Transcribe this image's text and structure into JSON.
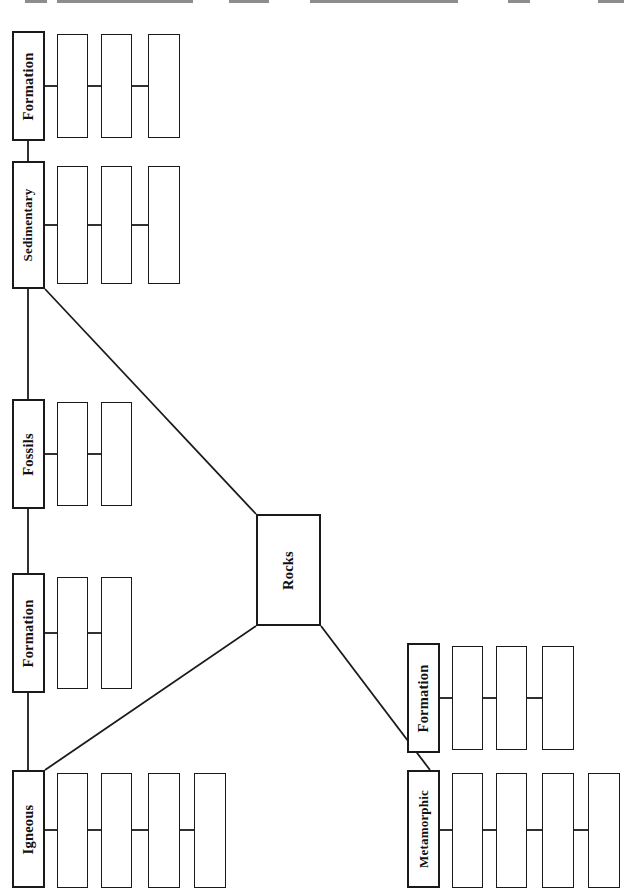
{
  "document": {
    "type": "concept-map-worksheet",
    "subject": "Rocks",
    "orientation": "rotated-90-counterclockwise",
    "page_background": "#ffffff",
    "line_color": "#1a1a1a",
    "text_color": "#111111"
  },
  "center": {
    "label": "Rocks",
    "x": 256,
    "y": 514,
    "w": 65,
    "h": 112
  },
  "branches": [
    {
      "key": "sedimentary",
      "label": "Sedimentary",
      "x": 12,
      "y": 161,
      "w": 33,
      "h": 128,
      "blanks": [
        {
          "x": 57,
          "y": 166,
          "w": 31,
          "h": 118
        },
        {
          "x": 101,
          "y": 166,
          "w": 31,
          "h": 118
        },
        {
          "x": 148,
          "y": 166,
          "w": 32,
          "h": 118
        }
      ]
    },
    {
      "key": "sedimentary-formation",
      "label": "Formation",
      "x": 12,
      "y": 31,
      "w": 33,
      "h": 110,
      "blanks": [
        {
          "x": 57,
          "y": 34,
          "w": 31,
          "h": 104
        },
        {
          "x": 101,
          "y": 34,
          "w": 31,
          "h": 104
        },
        {
          "x": 148,
          "y": 34,
          "w": 32,
          "h": 104
        }
      ]
    },
    {
      "key": "fossils",
      "label": "Fossils",
      "x": 12,
      "y": 399,
      "w": 33,
      "h": 110,
      "blanks": [
        {
          "x": 57,
          "y": 402,
          "w": 31,
          "h": 104
        },
        {
          "x": 101,
          "y": 402,
          "w": 31,
          "h": 104
        }
      ]
    },
    {
      "key": "igneous-formation",
      "label": "Formation",
      "x": 12,
      "y": 573,
      "w": 33,
      "h": 120,
      "blanks": [
        {
          "x": 57,
          "y": 577,
          "w": 31,
          "h": 112
        },
        {
          "x": 101,
          "y": 577,
          "w": 31,
          "h": 112
        }
      ]
    },
    {
      "key": "igneous",
      "label": "Igneous",
      "x": 12,
      "y": 770,
      "w": 33,
      "h": 118,
      "blanks": [
        {
          "x": 57,
          "y": 773,
          "w": 31,
          "h": 115
        },
        {
          "x": 101,
          "y": 773,
          "w": 31,
          "h": 115
        },
        {
          "x": 148,
          "y": 773,
          "w": 32,
          "h": 115
        },
        {
          "x": 194,
          "y": 773,
          "w": 32,
          "h": 115
        }
      ]
    },
    {
      "key": "metamorphic-formation",
      "label": "Formation",
      "x": 407,
      "y": 643,
      "w": 33,
      "h": 110,
      "blanks": [
        {
          "x": 452,
          "y": 646,
          "w": 31,
          "h": 104
        },
        {
          "x": 496,
          "y": 646,
          "w": 31,
          "h": 104
        },
        {
          "x": 542,
          "y": 646,
          "w": 32,
          "h": 104
        }
      ]
    },
    {
      "key": "metamorphic",
      "label": "Metamorphic",
      "x": 407,
      "y": 770,
      "w": 33,
      "h": 118,
      "blanks": [
        {
          "x": 452,
          "y": 773,
          "w": 31,
          "h": 115
        },
        {
          "x": 496,
          "y": 773,
          "w": 31,
          "h": 115
        },
        {
          "x": 542,
          "y": 773,
          "w": 32,
          "h": 115
        },
        {
          "x": 588,
          "y": 773,
          "w": 32,
          "h": 115
        }
      ]
    }
  ],
  "top_edge_fragments": [
    {
      "x": 25,
      "w": 22
    },
    {
      "x": 57,
      "w": 136
    },
    {
      "x": 229,
      "w": 40
    },
    {
      "x": 310,
      "w": 148
    },
    {
      "x": 508,
      "w": 22
    },
    {
      "x": 598,
      "w": 26
    }
  ]
}
